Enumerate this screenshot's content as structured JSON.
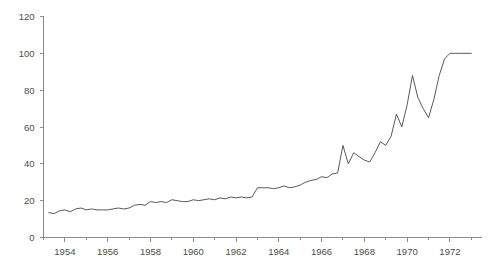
{
  "chart_data": {
    "type": "line",
    "title": "",
    "subtitle": "",
    "xlabel": "",
    "ylabel": "",
    "xlim": [
      1953.0,
      1973.5
    ],
    "ylim": [
      0,
      120
    ],
    "grid": false,
    "legend": null,
    "line_color": "#595959",
    "axis_color": "#8c8c8c",
    "label_color": "#4d4d4d",
    "background": "#ffffff",
    "yticks": [
      0,
      20,
      40,
      60,
      80,
      100,
      120
    ],
    "ytick_labels": [
      "0",
      "20",
      "40",
      "60",
      "80",
      "100",
      "120"
    ],
    "xticks": [
      1954,
      1956,
      1958,
      1960,
      1962,
      1964,
      1966,
      1968,
      1970,
      1972
    ],
    "xtick_labels": [
      "1954",
      "1956",
      "1958",
      "1960",
      "1962",
      "1964",
      "1966",
      "1968",
      "1970",
      "1972"
    ],
    "xminor_ticks": [
      1953,
      1955,
      1957,
      1959,
      1961,
      1963,
      1965,
      1967,
      1969,
      1971,
      1973
    ],
    "x": [
      1953.25,
      1953.5,
      1953.75,
      1954.0,
      1954.25,
      1954.5,
      1954.75,
      1955.0,
      1955.25,
      1955.5,
      1955.75,
      1956.0,
      1956.25,
      1956.5,
      1956.75,
      1957.0,
      1957.25,
      1957.5,
      1957.75,
      1958.0,
      1958.25,
      1958.5,
      1958.75,
      1959.0,
      1959.25,
      1959.5,
      1959.75,
      1960.0,
      1960.25,
      1960.5,
      1960.75,
      1961.0,
      1961.25,
      1961.5,
      1961.75,
      1962.0,
      1962.25,
      1962.5,
      1962.75,
      1963.0,
      1963.25,
      1963.5,
      1963.75,
      1964.0,
      1964.25,
      1964.5,
      1964.75,
      1965.0,
      1965.25,
      1965.5,
      1965.75,
      1966.0,
      1966.25,
      1966.5,
      1966.75,
      1967.0,
      1967.25,
      1967.5,
      1967.75,
      1968.0,
      1968.25,
      1968.5,
      1968.75,
      1969.0,
      1969.25,
      1969.5,
      1969.75,
      1970.0,
      1970.25,
      1970.5,
      1970.75,
      1971.0,
      1971.25,
      1971.5,
      1971.75,
      1972.0,
      1972.25,
      1972.5,
      1972.75,
      1973.0
    ],
    "y": [
      13.5,
      13.0,
      14.5,
      15.0,
      14.0,
      15.5,
      16.0,
      15.0,
      15.5,
      15.0,
      15.0,
      15.0,
      15.5,
      16.0,
      15.5,
      16.0,
      17.5,
      18.0,
      17.5,
      19.5,
      19.0,
      19.5,
      19.0,
      20.5,
      20.0,
      19.5,
      19.5,
      20.5,
      20.0,
      20.5,
      21.0,
      20.5,
      21.5,
      21.0,
      22.0,
      21.5,
      22.0,
      21.5,
      22.0,
      27.0,
      27.0,
      27.0,
      26.5,
      27.0,
      28.0,
      27.0,
      27.5,
      28.5,
      30.0,
      31.0,
      31.5,
      33.0,
      32.5,
      34.5,
      35.0,
      50.0,
      40.0,
      46.0,
      44.0,
      42.0,
      41.0,
      46.0,
      52.0,
      50.0,
      55.0,
      67.0,
      60.0,
      72.0,
      88.0,
      76.0,
      70.0,
      65.0,
      75.0,
      88.0,
      97.0,
      100.0,
      100.0,
      100.0,
      100.0,
      100.0
    ]
  },
  "axes": {
    "y_axis_name": "y-axis",
    "x_axis_name": "x-axis"
  }
}
